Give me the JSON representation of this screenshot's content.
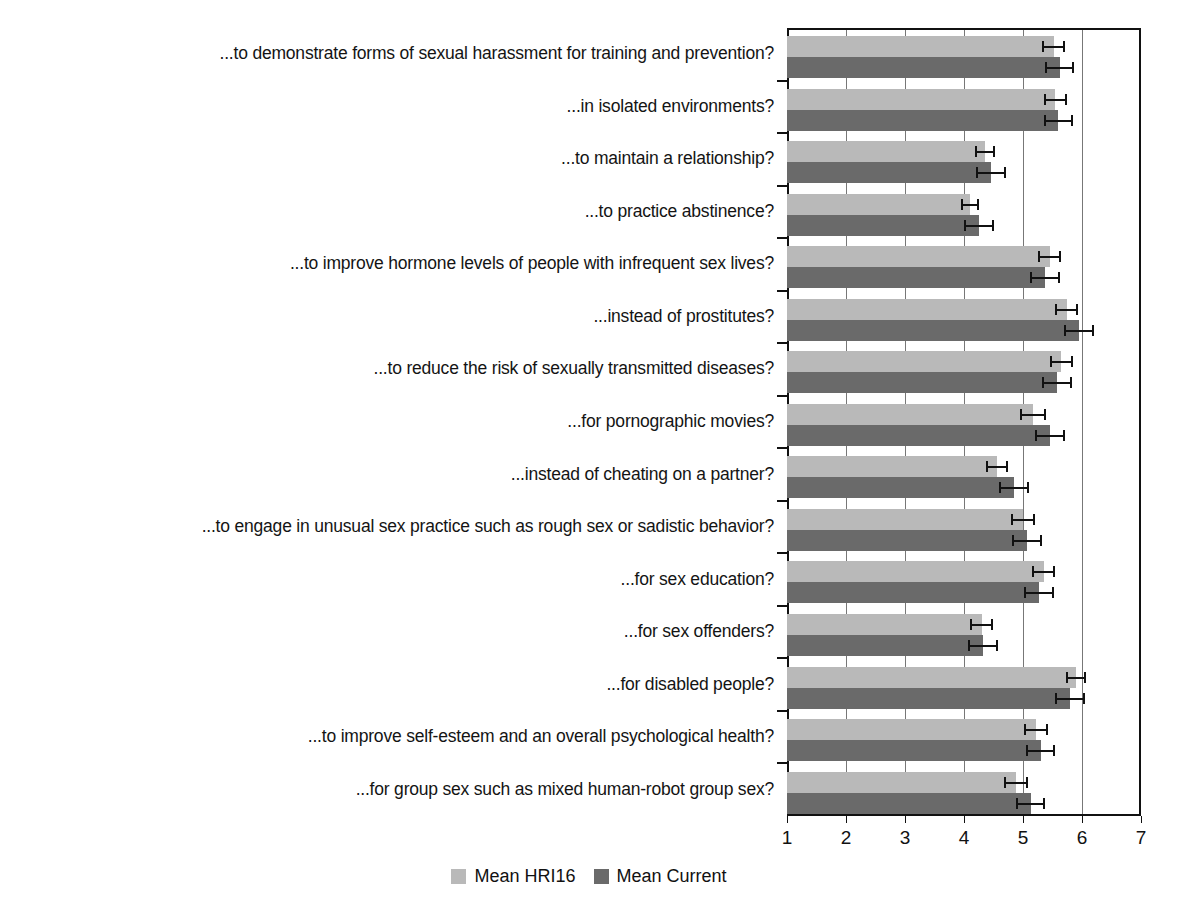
{
  "chart_data": {
    "type": "bar",
    "orientation": "horizontal",
    "title": "",
    "xlabel": "",
    "ylabel": "",
    "xlim": [
      1,
      7
    ],
    "xticks": [
      1,
      2,
      3,
      4,
      5,
      6,
      7
    ],
    "grid": true,
    "legend_position": "bottom",
    "categories": [
      "...to demonstrate forms of sexual harassment for training and prevention?",
      "...in isolated environments?",
      "...to maintain a relationship?",
      "...to practice abstinence?",
      "...to improve hormone levels of people with infrequent sex lives?",
      "...instead of prostitutes?",
      "...to reduce the risk of sexually transmitted diseases?",
      "...for pornographic movies?",
      "...instead of cheating on a partner?",
      "...to engage in unusual sex practice such as rough sex or sadistic behavior?",
      "...for sex education?",
      "...for sex offenders?",
      "...for disabled people?",
      "...to improve self-esteem and an overall psychological health?",
      "...for group sex such as mixed human-robot group sex?"
    ],
    "series": [
      {
        "name": "Mean HRI16",
        "color": "#b9b9b9",
        "values": [
          5.52,
          5.55,
          4.35,
          4.1,
          5.45,
          5.74,
          5.65,
          5.17,
          4.56,
          5.0,
          5.35,
          4.3,
          5.9,
          5.22,
          4.88
        ],
        "errors": [
          0.2,
          0.2,
          0.17,
          0.15,
          0.2,
          0.2,
          0.2,
          0.22,
          0.18,
          0.2,
          0.2,
          0.2,
          0.17,
          0.2,
          0.2
        ]
      },
      {
        "name": "Mean Current",
        "color": "#6a6a6a",
        "values": [
          5.62,
          5.6,
          4.46,
          4.25,
          5.37,
          5.95,
          5.58,
          5.46,
          4.85,
          5.07,
          5.27,
          4.32,
          5.8,
          5.3,
          5.13
        ],
        "errors": [
          0.25,
          0.25,
          0.25,
          0.25,
          0.25,
          0.25,
          0.25,
          0.25,
          0.25,
          0.25,
          0.25,
          0.25,
          0.25,
          0.25,
          0.25
        ]
      }
    ]
  },
  "axis": {
    "tick_labels": [
      "1",
      "2",
      "3",
      "4",
      "5",
      "6",
      "7"
    ]
  },
  "legend": {
    "items": [
      {
        "label": "Mean HRI16",
        "swatch": "light"
      },
      {
        "label": "Mean Current",
        "swatch": "dark"
      }
    ]
  }
}
